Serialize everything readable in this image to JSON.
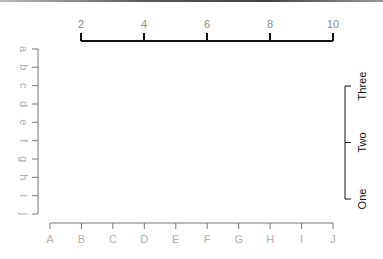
{
  "chart_data": {
    "type": "axes",
    "title": "",
    "plot_area": "empty",
    "axes": {
      "top": {
        "side": "top",
        "type": "numeric",
        "range": [
          2,
          10
        ],
        "ticks": [
          "2",
          "4",
          "6",
          "8",
          "10"
        ],
        "label_color": "#8c8c8c",
        "line_color": "#111111"
      },
      "left": {
        "side": "left",
        "type": "categorical",
        "ticks": [
          "a",
          "b",
          "c",
          "d",
          "e",
          "f",
          "g",
          "h",
          "i",
          "j"
        ],
        "label_rotation": 90,
        "label_color": "#b0b0b0",
        "line_color": "#777777"
      },
      "bottom": {
        "side": "bottom",
        "type": "categorical",
        "ticks": [
          "A",
          "B",
          "C",
          "D",
          "E",
          "F",
          "G",
          "H",
          "I",
          "J"
        ],
        "label_color": "#b0b0b0",
        "line_color": "#777777"
      },
      "right": {
        "side": "right",
        "type": "categorical",
        "ticks": [
          "One",
          "Two",
          "Three"
        ],
        "label_rotation": -90,
        "label_color": "#111111",
        "line_color": "#111111"
      }
    },
    "grid": false,
    "legend": null
  }
}
